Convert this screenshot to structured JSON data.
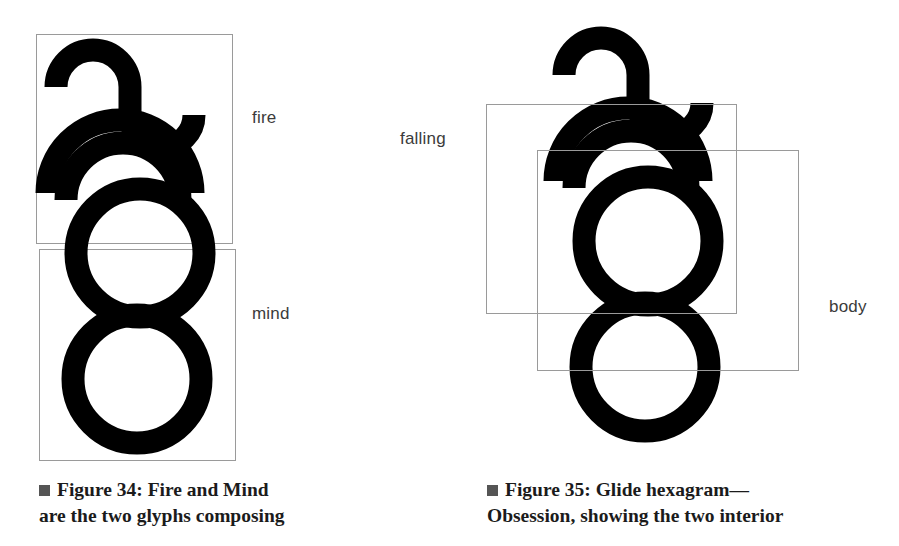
{
  "page": {
    "background": "#ffffff",
    "ink": "#000000",
    "box_stroke": "#9a9a9a",
    "label_color": "#3b3b3b",
    "caption_color": "#1b1b1b",
    "bullet_color": "#555555"
  },
  "figures": [
    {
      "id": "figure-34",
      "glyph_name": "glide-hexagram-fire-mind",
      "labels": [
        {
          "name": "fire",
          "text": "fire"
        },
        {
          "name": "mind",
          "text": "mind"
        }
      ],
      "boxes": [
        {
          "name": "fire-box",
          "x": 36,
          "y": 34,
          "w": 196,
          "h": 209
        },
        {
          "name": "mind-box",
          "x": 39,
          "y": 249,
          "w": 196,
          "h": 211
        }
      ],
      "caption": {
        "bullet": "filled-square-bullet",
        "line1": "Figure 34: Fire and Mind",
        "line2": "are the two glyphs composing"
      }
    },
    {
      "id": "figure-35",
      "glyph_name": "glide-hexagram-obsession",
      "labels": [
        {
          "name": "falling",
          "text": "falling"
        },
        {
          "name": "body",
          "text": "body"
        }
      ],
      "boxes": [
        {
          "name": "falling-box",
          "x": 486,
          "y": 104,
          "w": 250,
          "h": 209
        },
        {
          "name": "body-box",
          "x": 537,
          "y": 150,
          "w": 261,
          "h": 220
        }
      ],
      "caption": {
        "bullet": "filled-square-bullet",
        "line1": "Figure 35: Glide hexagram—",
        "line2": "Obsession, showing the two interior"
      }
    }
  ]
}
